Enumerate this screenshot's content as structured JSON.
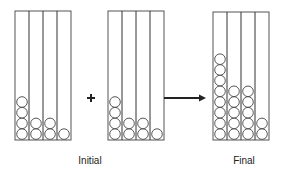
{
  "diagram": {
    "containers": [
      {
        "id": "initial-a",
        "columns": [
          4,
          2,
          2,
          1
        ]
      },
      {
        "id": "initial-b",
        "columns": [
          4,
          2,
          2,
          1
        ]
      },
      {
        "id": "final",
        "columns": [
          8,
          5,
          5,
          2
        ]
      }
    ],
    "operator": "+",
    "arrow": "right",
    "labels": {
      "initial": "Initial",
      "final": "Final"
    }
  }
}
